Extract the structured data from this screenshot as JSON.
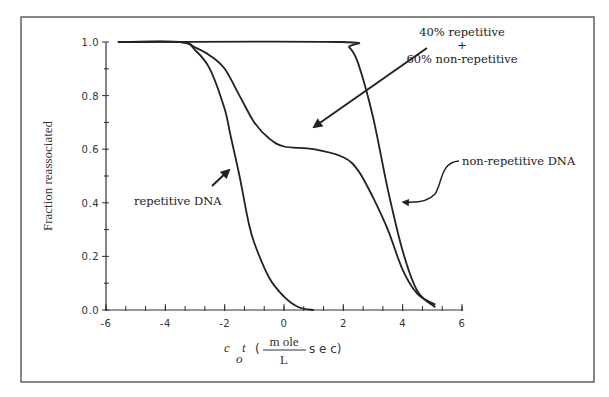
{
  "chart_data": {
    "type": "line",
    "title": "",
    "xlabel": "c_o t (mole/L sec)",
    "ylabel": "Fraction reassociated",
    "xlim": [
      -6,
      6
    ],
    "ylim": [
      0.0,
      1.0
    ],
    "grid": false,
    "legend": "none (curves labeled by annotations)",
    "x_ticks": [
      -6,
      -4,
      -2,
      0,
      2,
      4,
      6
    ],
    "x_tick_labels": [
      "-6",
      "-4",
      "-2",
      "0",
      "2",
      "4",
      "6"
    ],
    "y_ticks": [
      0.0,
      0.2,
      0.4,
      0.6,
      0.8,
      1.0
    ],
    "y_tick_labels": [
      "0.0",
      "0.2",
      "0.4",
      "0.6",
      "0.8",
      "1.0"
    ],
    "series": [
      {
        "name": "repetitive DNA",
        "x": [
          -5.6,
          -3.5,
          -3.0,
          -2.5,
          -2.0,
          -1.8,
          -1.5,
          -1.2,
          -1.0,
          -0.5,
          0.0,
          0.5,
          1.0
        ],
        "y": [
          1.0,
          1.0,
          0.97,
          0.9,
          0.75,
          0.65,
          0.5,
          0.33,
          0.25,
          0.12,
          0.05,
          0.01,
          0.0
        ]
      },
      {
        "name": "40% repetitive + 60% non-repetitive",
        "x": [
          -5.6,
          -3.5,
          -3.0,
          -2.5,
          -2.0,
          -1.5,
          -1.0,
          -0.5,
          0.0,
          1.0,
          2.0,
          2.5,
          3.0,
          3.5,
          4.0,
          4.5,
          5.1
        ],
        "y": [
          1.0,
          1.0,
          0.98,
          0.95,
          0.9,
          0.8,
          0.7,
          0.64,
          0.61,
          0.6,
          0.57,
          0.52,
          0.42,
          0.3,
          0.15,
          0.06,
          0.02
        ]
      },
      {
        "name": "non-repetitive DNA",
        "x": [
          -5.6,
          1.9,
          2.2,
          2.5,
          3.0,
          3.5,
          4.0,
          4.5,
          5.1
        ],
        "y": [
          1.0,
          1.0,
          0.98,
          0.92,
          0.72,
          0.45,
          0.22,
          0.07,
          0.01
        ]
      }
    ],
    "annotations": [
      {
        "text": "40% repetitive",
        "line": 1
      },
      {
        "text": "+",
        "line": 2
      },
      {
        "text": "60% non-repetitive",
        "line": 3
      },
      {
        "text": "non-repetitive DNA"
      },
      {
        "text": "repetitive DNA"
      }
    ]
  },
  "labels": {
    "ylabel": "Fraction reassociated",
    "xlabel_c": "c",
    "xlabel_o": "o",
    "xlabel_t": "t",
    "xlabel_open": "(",
    "xlabel_num": "m ole",
    "xlabel_den": "L",
    "xlabel_sec": "s e c)",
    "ann_mix_1": "40% repetitive",
    "ann_mix_2": "+",
    "ann_mix_3": "60% non-repetitive",
    "ann_nonrep": "non-repetitive DNA",
    "ann_rep": "repetitive DNA"
  }
}
